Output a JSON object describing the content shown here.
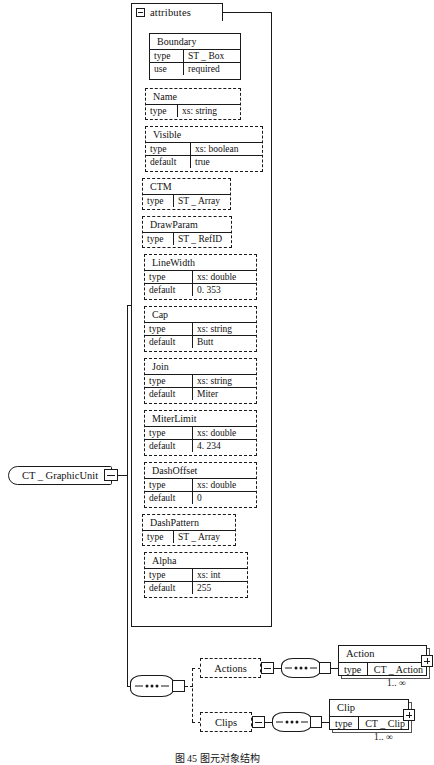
{
  "diagram": {
    "caption": "图 45  图元对象结构",
    "root": {
      "label": "CT _ GraphicUnit",
      "toggle_icon": "minus-box-icon"
    },
    "attributes_group": {
      "label": "attributes",
      "toggle_icon": "minus-box-icon"
    },
    "attributes": [
      {
        "name": "Boundary",
        "required": true,
        "rows": [
          {
            "key": "type",
            "value": "ST _ Box"
          },
          {
            "key": "use",
            "value": "required"
          }
        ]
      },
      {
        "name": "Name",
        "required": false,
        "rows": [
          {
            "key": "type",
            "value": "xs: string"
          }
        ]
      },
      {
        "name": "Visible",
        "required": false,
        "rows": [
          {
            "key": "type",
            "value": "xs: boolean"
          },
          {
            "key": "default",
            "value": "true"
          }
        ]
      },
      {
        "name": "CTM",
        "required": false,
        "rows": [
          {
            "key": "type",
            "value": "ST _ Array"
          }
        ]
      },
      {
        "name": "DrawParam",
        "required": false,
        "rows": [
          {
            "key": "type",
            "value": "ST _ RefID"
          }
        ]
      },
      {
        "name": "LineWidth",
        "required": false,
        "rows": [
          {
            "key": "type",
            "value": "xs: double"
          },
          {
            "key": "default",
            "value": "0. 353"
          }
        ]
      },
      {
        "name": "Cap",
        "required": false,
        "rows": [
          {
            "key": "type",
            "value": "xs: string"
          },
          {
            "key": "default",
            "value": "Butt"
          }
        ]
      },
      {
        "name": "Join",
        "required": false,
        "rows": [
          {
            "key": "type",
            "value": "xs: string"
          },
          {
            "key": "default",
            "value": "Miter"
          }
        ]
      },
      {
        "name": "MiterLimit",
        "required": false,
        "rows": [
          {
            "key": "type",
            "value": "xs: double"
          },
          {
            "key": "default",
            "value": "4. 234"
          }
        ]
      },
      {
        "name": "DashOffset",
        "required": false,
        "rows": [
          {
            "key": "type",
            "value": "xs: double"
          },
          {
            "key": "default",
            "value": "0"
          }
        ]
      },
      {
        "name": "DashPattern",
        "required": false,
        "rows": [
          {
            "key": "type",
            "value": "ST _ Array"
          }
        ]
      },
      {
        "name": "Alpha",
        "required": false,
        "rows": [
          {
            "key": "type",
            "value": "xs: int"
          },
          {
            "key": "default",
            "value": "255"
          }
        ]
      }
    ],
    "branches": [
      {
        "wrapper_label": "Actions",
        "wrapper_toggle_icon": "minus-box-icon",
        "sequence_icon": "sequence-node-icon",
        "element": {
          "name": "Action",
          "row": {
            "key": "type",
            "value": "CT _ Action"
          },
          "expand_icon": "plus-box-icon",
          "cardinality": "1.. ∞"
        }
      },
      {
        "wrapper_label": "Clips",
        "wrapper_toggle_icon": "minus-box-icon",
        "sequence_icon": "sequence-node-icon",
        "element": {
          "name": "Clip",
          "row": {
            "key": "type",
            "value": "CT _ Clip"
          },
          "expand_icon": "plus-box-icon",
          "cardinality": "1.. ∞"
        }
      }
    ],
    "root_sequence_icon": "sequence-node-icon"
  }
}
